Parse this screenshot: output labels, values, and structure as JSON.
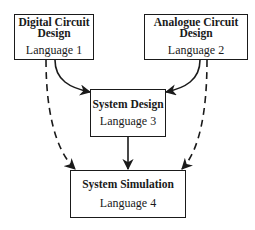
{
  "nodes": [
    {
      "id": "digital",
      "title": "Digital Circuit Design",
      "language": "Language 1"
    },
    {
      "id": "analogue",
      "title": "Analogue Circuit Design",
      "language": "Language 2"
    },
    {
      "id": "system_design",
      "title": "System Design",
      "language": "Language 3"
    },
    {
      "id": "system_simulation",
      "title": "System Simulation",
      "language": "Language 4"
    }
  ],
  "edges": [
    {
      "from": "digital",
      "to": "system_design",
      "style": "solid"
    },
    {
      "from": "analogue",
      "to": "system_design",
      "style": "solid"
    },
    {
      "from": "system_design",
      "to": "system_simulation",
      "style": "solid"
    },
    {
      "from": "digital",
      "to": "system_simulation",
      "style": "dashed"
    },
    {
      "from": "analogue",
      "to": "system_simulation",
      "style": "dashed"
    }
  ],
  "colors": {
    "line": "#1a1a1a",
    "background": "#ffffff"
  }
}
